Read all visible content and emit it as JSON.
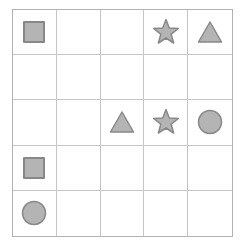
{
  "grid": {
    "rows": 5,
    "cols": 5,
    "background": "#ffffff",
    "line_color": "#c6c6c6",
    "border_color": "#b2b2b2"
  },
  "shapes": {
    "fill_color": "#b4b4b4",
    "stroke_color": "#888888",
    "items": [
      {
        "row": 0,
        "col": 0,
        "type": "square"
      },
      {
        "row": 0,
        "col": 3,
        "type": "star"
      },
      {
        "row": 0,
        "col": 4,
        "type": "triangle"
      },
      {
        "row": 2,
        "col": 2,
        "type": "triangle"
      },
      {
        "row": 2,
        "col": 3,
        "type": "star"
      },
      {
        "row": 2,
        "col": 4,
        "type": "circle"
      },
      {
        "row": 3,
        "col": 0,
        "type": "square"
      },
      {
        "row": 4,
        "col": 0,
        "type": "circle"
      }
    ]
  }
}
